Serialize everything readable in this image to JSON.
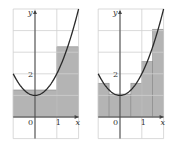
{
  "figure": {
    "function": "y = x^2 + 1",
    "panels": [
      {
        "name": "midpoint-n3",
        "x_range": [
          -1,
          2
        ],
        "y_range": [
          -1,
          5
        ],
        "labels": {
          "y_axis": "y",
          "x_axis": "x",
          "origin": "0",
          "x_tick": "1",
          "y_tick": "2"
        },
        "rectangles": [
          {
            "x0": -1,
            "x1": 0,
            "height": 1.25
          },
          {
            "x0": 0,
            "x1": 1,
            "height": 1.25
          },
          {
            "x0": 1,
            "x1": 2,
            "height": 3.25
          }
        ]
      },
      {
        "name": "midpoint-n6",
        "x_range": [
          -1,
          2
        ],
        "y_range": [
          -1,
          5
        ],
        "labels": {
          "y_axis": "y",
          "x_axis": "x",
          "origin": "0",
          "x_tick": "1",
          "y_tick": "2"
        },
        "rectangles": [
          {
            "x0": -1,
            "x1": -0.5,
            "height": 1.5625
          },
          {
            "x0": -0.5,
            "x1": 0,
            "height": 1.0625
          },
          {
            "x0": 0,
            "x1": 0.5,
            "height": 1.0625
          },
          {
            "x0": 0.5,
            "x1": 1,
            "height": 1.5625
          },
          {
            "x0": 1,
            "x1": 1.5,
            "height": 2.5625
          },
          {
            "x0": 1.5,
            "x1": 2,
            "height": 4.0625
          }
        ]
      }
    ],
    "colors": {
      "fill": "#b4b4b4",
      "grid": "#cfcfcf",
      "curve": "#2a2a2a",
      "axis": "#444444"
    }
  }
}
